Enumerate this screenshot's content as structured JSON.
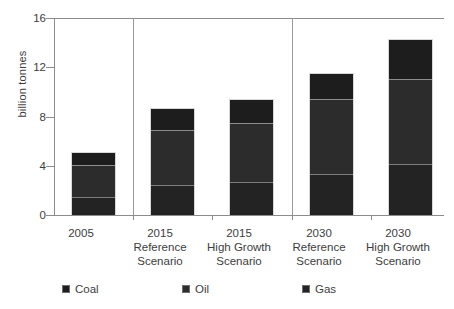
{
  "chart_data": {
    "type": "bar",
    "subtype": "stacked-bar",
    "title": "",
    "xlabel": "",
    "ylabel": "billion tonnes",
    "ylim": [
      0,
      16
    ],
    "yticks": [
      0,
      4,
      8,
      12,
      16
    ],
    "ytick_labels": [
      "0",
      "4",
      "8",
      "12",
      "16"
    ],
    "grid": false,
    "legend_position": "bottom",
    "categories": [
      "2005",
      "2015 Reference Scenario",
      "2015 High Growth Scenario",
      "2030 Reference Scenario",
      "2030 High Growth Scenario"
    ],
    "category_lines": [
      [
        "2005"
      ],
      [
        "2015",
        "Reference",
        "Scenario"
      ],
      [
        "2015",
        "High Growth",
        "Scenario"
      ],
      [
        "2030",
        "Reference",
        "Scenario"
      ],
      [
        "2030",
        "High Growth",
        "Scenario"
      ]
    ],
    "series": [
      {
        "name": "Gas",
        "color": "#232323",
        "values": [
          1.4,
          2.4,
          2.6,
          3.3,
          4.1
        ]
      },
      {
        "name": "Oil",
        "color": "#2c2c2c",
        "values": [
          2.7,
          4.6,
          4.9,
          6.2,
          7.0
        ]
      },
      {
        "name": "Coal",
        "color": "#1d1d1d",
        "values": [
          1.0,
          1.7,
          1.9,
          2.0,
          3.2
        ]
      }
    ],
    "stack_order_bottom_to_top": [
      "Gas",
      "Oil",
      "Coal"
    ],
    "totals": [
      5.1,
      8.7,
      9.4,
      11.5,
      14.3
    ],
    "group_separators_after": [
      1,
      3
    ]
  },
  "legend": {
    "items": [
      {
        "label": "Coal",
        "color": "#1d1d1d",
        "swatch": "legend-swatch"
      },
      {
        "label": "Oil",
        "color": "#2c2c2c",
        "swatch": "legend-swatch"
      },
      {
        "label": "Gas",
        "color": "#232323",
        "swatch": "legend-swatch"
      }
    ]
  },
  "axis": {
    "y_title": "billion tonnes",
    "y_tick_0": "0",
    "y_tick_1": "4",
    "y_tick_2": "8",
    "y_tick_3": "12",
    "y_tick_4": "16"
  },
  "x_labels": {
    "b0_l0": "2005",
    "b1_l0": "2015",
    "b1_l1": "Reference",
    "b1_l2": "Scenario",
    "b2_l0": "2015",
    "b2_l1": "High Growth",
    "b2_l2": "Scenario",
    "b3_l0": "2030",
    "b3_l1": "Reference",
    "b3_l2": "Scenario",
    "b4_l0": "2030",
    "b4_l1": "High Growth",
    "b4_l2": "Scenario"
  },
  "colors": {
    "coal": "#1d1d1d",
    "oil": "#2c2c2c",
    "gas": "#232323",
    "axis": "#8c8c8c",
    "text": "#3d3d3d",
    "background": "#ffffff"
  }
}
